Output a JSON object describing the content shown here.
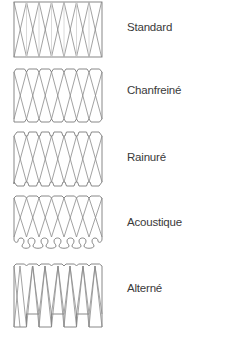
{
  "profiles": [
    {
      "name": "Standard",
      "label_y": 21,
      "panel_y": 1,
      "panel_h": 57,
      "edge": "straight"
    },
    {
      "name": "Chanfreiné",
      "label_y": 84,
      "panel_y": 68,
      "panel_h": 55,
      "edge": "chamfered"
    },
    {
      "name": "Rainuré",
      "label_y": 151,
      "panel_y": 131,
      "panel_h": 56,
      "edge": "grooved"
    },
    {
      "name": "Acoustique",
      "label_y": 216,
      "panel_y": 195,
      "panel_h": 56,
      "edge": "acoustic"
    },
    {
      "name": "Alterné",
      "label_y": 282,
      "panel_y": 263,
      "panel_h": 66,
      "edge": "alternating"
    }
  ],
  "style": {
    "line_color": "#8a8a8a",
    "text_color": "#3a3a3a",
    "background": "#ffffff"
  }
}
